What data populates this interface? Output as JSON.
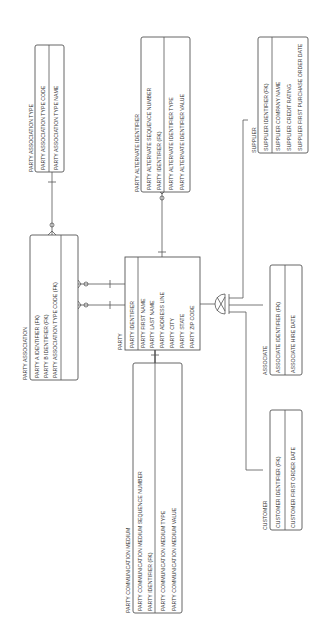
{
  "colors": {
    "line": "#555555",
    "text": "#333333",
    "background": "#ffffff"
  },
  "entities": {
    "party_association_type": {
      "name": "PARTY ASSOCIATION TYPE",
      "key_attrs": [
        "PARTY ASSOCIATION TYPE CODE"
      ],
      "attrs": [
        "PARTY ASSOCIATION TYPE NAME"
      ]
    },
    "party_alternate_identifier": {
      "name": "PARTY ALTERNATE IDENTIFIER",
      "key_attrs": [
        "PARTY ALTERNATE SEQUENCE NUMBER",
        "PARTY IDENTIFIER (FK)"
      ],
      "attrs": [
        "PARTY ALTERNATE IDENTIFIER TYPE",
        "PARTY ALTERNATE IDENTIFIER VALUE"
      ]
    },
    "supplier": {
      "name": "SUPPLIER",
      "key_attrs": [
        "SUPPLIER IDENTIFIER (FK)"
      ],
      "attrs": [
        "SUPPLIER COMPANY NAME",
        "SUPPLIER CREDIT RATING",
        "SUPPLIER FIRST PURCHASE ORDER DATE"
      ]
    },
    "party_association": {
      "name": "PARTY ASSOCIATION",
      "key_attrs": [
        "PARTY A IDENTIFIER (FK)",
        "PARTY B IDENTIFIER (FK)",
        "PARTY ASSOCIATION TYPE CODE (FK)"
      ],
      "attrs": []
    },
    "party": {
      "name": "PARTY",
      "key_attrs": [
        "PARTY IDENTIFIER"
      ],
      "attrs": [
        "PARTY FIRST NAME",
        "PARTY LAST NAME",
        "PARTY ADDRESS LINE",
        "PARTY CITY",
        "PARTY STATE",
        "PARTY ZIP CODE"
      ]
    },
    "associate": {
      "name": "ASSOCIATE",
      "key_attrs": [
        "ASSOCIATE IDENTIFIER (FK)"
      ],
      "attrs": [
        "ASSOCIATE HIRE DATE"
      ]
    },
    "party_communication_medium": {
      "name": "PARTY COMMUNICATION MEDIUM",
      "key_attrs": [
        "PARTY COMMUNICATION MEDIUM SEQUENCE NUMBER",
        "PARTY IDENTIFIER (FK)"
      ],
      "attrs": [
        "PARTY COMMUNICATION MEDIUM TYPE",
        "PARTY COMMUNICATION MEDIUM VALUE"
      ]
    },
    "customer": {
      "name": "CUSTOMER",
      "key_attrs": [
        "CUSTOMER IDENTIFIER (FK)"
      ],
      "attrs": [
        "CUSTOMER FIRST ORDER DATE"
      ]
    }
  }
}
